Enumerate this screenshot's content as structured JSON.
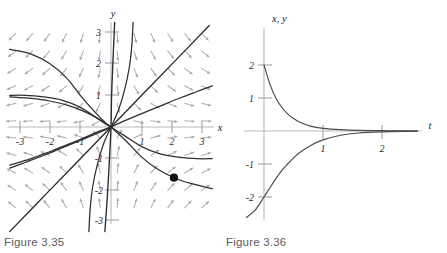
{
  "figures": [
    {
      "id": "figure-3-35",
      "caption": "Figure 3.35",
      "type": "phase-portrait",
      "axis_labels": {
        "x": "x",
        "y": "y"
      },
      "x_ticks": [
        "-3",
        "-2",
        "-1",
        "1",
        "2",
        "3"
      ],
      "y_ticks": [
        "3",
        "2",
        "1",
        "-1",
        "-2",
        "-3"
      ],
      "colors": {
        "axis": "#b9b9b9",
        "trajectory": "#2e2e2e",
        "field": "#b0b0b0",
        "dot": "#111111"
      },
      "initial_point": {
        "x": 2.05,
        "y": -1.6
      }
    },
    {
      "id": "figure-3-36",
      "caption": "Figure 3.36",
      "type": "solution-curves",
      "axis_labels": {
        "x": "t",
        "y": "x, y"
      },
      "x_ticks": [
        "1",
        "2"
      ],
      "y_ticks": [
        "2",
        "1",
        "-1",
        "-2"
      ],
      "colors": {
        "axis": "#b9b9b9",
        "curve": "#4a4a4a"
      }
    }
  ],
  "chart_data": [
    {
      "type": "scatter",
      "title": "Figure 3.35",
      "subtitle": "",
      "xlabel": "x",
      "ylabel": "y",
      "xlim": [
        -3.4,
        3.4
      ],
      "ylim": [
        -3.4,
        3.4
      ],
      "grid": false,
      "legend": "none",
      "xticks": [
        -3,
        -2,
        -1,
        1,
        2,
        3
      ],
      "yticks": [
        3,
        2,
        1,
        -1,
        -2,
        -3
      ],
      "description": "Direction field of a planar linear system with a saddle point at the origin, overlaid with solution trajectories and one marked initial condition.",
      "annotations": [
        {
          "label": "initial condition dot",
          "x": 2.05,
          "y": -1.6
        }
      ],
      "series": [
        {
          "name": "unstable separatrix (y = x)",
          "kind": "line",
          "points": [
            [
              -3.3,
              -3.3
            ],
            [
              -2,
              -2
            ],
            [
              -1,
              -1
            ],
            [
              0,
              0
            ],
            [
              1,
              1
            ],
            [
              2,
              2
            ],
            [
              3.2,
              3.2
            ]
          ]
        },
        {
          "name": "stable separatrix (vertical, y axis direction)",
          "kind": "line",
          "points": [
            [
              0.12,
              3.3
            ],
            [
              0.06,
              2.0
            ],
            [
              0.02,
              1.0
            ],
            [
              0,
              0
            ],
            [
              -0.05,
              -1.0
            ],
            [
              -0.12,
              -2.2
            ],
            [
              -0.2,
              -3.3
            ]
          ]
        },
        {
          "name": "trajectory upper-left A",
          "kind": "line",
          "points": [
            [
              -3.3,
              2.45
            ],
            [
              -2.6,
              2.3
            ],
            [
              -2.0,
              2.0
            ],
            [
              -1.45,
              1.55
            ],
            [
              -1.0,
              1.0
            ],
            [
              -0.55,
              0.5
            ],
            [
              -0.2,
              0.15
            ],
            [
              0,
              0
            ]
          ]
        },
        {
          "name": "trajectory upper-left B",
          "kind": "line",
          "points": [
            [
              -3.3,
              0.95
            ],
            [
              -2.6,
              0.9
            ],
            [
              -2.0,
              0.82
            ],
            [
              -1.4,
              0.68
            ],
            [
              -0.9,
              0.5
            ],
            [
              -0.45,
              0.28
            ],
            [
              -0.15,
              0.08
            ],
            [
              0,
              0
            ]
          ]
        },
        {
          "name": "trajectory lower-left C",
          "kind": "line",
          "points": [
            [
              -3.3,
              -1.2
            ],
            [
              -2.6,
              -1.0
            ],
            [
              -2.0,
              -0.78
            ],
            [
              -1.4,
              -0.55
            ],
            [
              -0.9,
              -0.35
            ],
            [
              -0.4,
              -0.14
            ],
            [
              0,
              0
            ]
          ]
        },
        {
          "name": "trajectory upper-right D",
          "kind": "line",
          "points": [
            [
              0,
              0
            ],
            [
              0.45,
              0.2
            ],
            [
              1.0,
              0.42
            ],
            [
              1.6,
              0.66
            ],
            [
              2.2,
              0.9
            ],
            [
              2.8,
              1.12
            ],
            [
              3.3,
              1.3
            ]
          ]
        },
        {
          "name": "trajectory lower-right E",
          "kind": "line",
          "points": [
            [
              0,
              0
            ],
            [
              0.45,
              -0.28
            ],
            [
              1.0,
              -0.62
            ],
            [
              1.6,
              -0.85
            ],
            [
              2.2,
              -0.95
            ],
            [
              2.8,
              -1.0
            ],
            [
              3.3,
              -1.0
            ]
          ]
        },
        {
          "name": "trajectory through initial point",
          "kind": "line",
          "points": [
            [
              0,
              0
            ],
            [
              0.5,
              -0.45
            ],
            [
              1.0,
              -0.95
            ],
            [
              1.5,
              -1.32
            ],
            [
              2.05,
              -1.6
            ],
            [
              2.6,
              -1.78
            ],
            [
              3.3,
              -1.95
            ]
          ]
        },
        {
          "name": "trajectory inner upper right",
          "kind": "line",
          "points": [
            [
              0,
              0
            ],
            [
              0.25,
              0.55
            ],
            [
              0.45,
              1.2
            ],
            [
              0.6,
              1.9
            ],
            [
              0.68,
              2.6
            ],
            [
              0.72,
              3.3
            ]
          ]
        }
      ]
    },
    {
      "type": "line",
      "title": "Figure 3.36",
      "subtitle": "",
      "xlabel": "t",
      "ylabel": "x, y",
      "xlim": [
        -0.35,
        2.7
      ],
      "ylim": [
        -2.6,
        2.9
      ],
      "grid": false,
      "legend": "none",
      "xticks": [
        1,
        2
      ],
      "yticks": [
        2,
        1,
        -1,
        -2
      ],
      "description": "Two solution curves versus time: one decaying from +2 down to 0 and its mirror rising from -2 up to 0, both approaching the t axis asymptotically.",
      "series": [
        {
          "name": "decaying solution (positive branch)",
          "x": [
            -0.3,
            -0.15,
            0,
            0.1,
            0.2,
            0.3,
            0.4,
            0.5,
            0.6,
            0.8,
            1.0,
            1.3,
            1.6,
            2.0,
            2.4,
            2.6
          ],
          "y": [
            8.0,
            4.1,
            2.0,
            1.42,
            1.0,
            0.72,
            0.52,
            0.38,
            0.27,
            0.14,
            0.08,
            0.04,
            0.02,
            0.01,
            0.005,
            0.004
          ]
        },
        {
          "name": "decaying solution (negative branch)",
          "x": [
            -0.3,
            -0.15,
            0,
            0.1,
            0.2,
            0.3,
            0.4,
            0.5,
            0.6,
            0.8,
            1.0,
            1.3,
            1.6,
            2.0,
            2.4,
            2.6
          ],
          "y": [
            -2.62,
            -2.4,
            -2.0,
            -1.72,
            -1.45,
            -1.2,
            -1.0,
            -0.82,
            -0.66,
            -0.43,
            -0.27,
            -0.13,
            -0.06,
            -0.025,
            -0.01,
            -0.008
          ]
        }
      ]
    }
  ]
}
